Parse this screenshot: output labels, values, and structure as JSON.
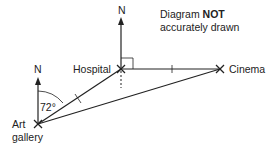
{
  "note": {
    "prefix": "Diagram",
    "emphasis": "NOT",
    "suffix": "accurately drawn"
  },
  "points": {
    "hospital": {
      "label": "Hospital"
    },
    "cinema": {
      "label": "Cinema"
    },
    "art_gallery": {
      "label_line1": "Art",
      "label_line2": "gallery"
    }
  },
  "north_labels": {
    "hospital_north": "N",
    "art_gallery_north": "N"
  },
  "angles": {
    "bearing_art_gallery_to_hospital": "72°",
    "hospital_right_angle": "90°"
  },
  "equal_length_marks": [
    "Art gallery–Hospital",
    "Hospital–Cinema"
  ],
  "colors": {
    "line": "#222222",
    "text": "#222222",
    "background": "#ffffff"
  }
}
